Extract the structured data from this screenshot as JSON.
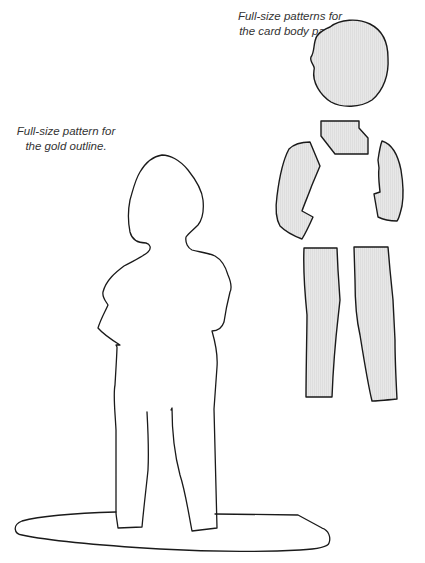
{
  "captions": {
    "body_parts": {
      "line1": "Full-size patterns for",
      "line2": "the card body parts."
    },
    "gold_outline": {
      "line1": "Full-size pattern for",
      "line2": "the gold outline."
    }
  },
  "colors": {
    "background": "#ffffff",
    "piece_fill": "#e6e6e6",
    "piece_hatch": "#d4d4d4",
    "stroke": "#1a1a1a",
    "caption_text": "#333333"
  },
  "pieces": [
    {
      "name": "head"
    },
    {
      "name": "torso"
    },
    {
      "name": "left-arm"
    },
    {
      "name": "right-arm"
    },
    {
      "name": "left-leg"
    },
    {
      "name": "right-leg"
    }
  ]
}
